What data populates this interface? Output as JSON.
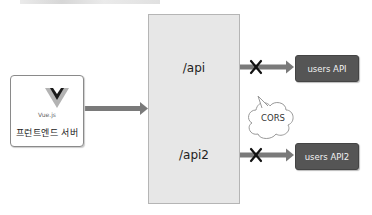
{
  "diagram": {
    "top_text_cropped": "",
    "frontend": {
      "logo_label": "Vue.js",
      "label": "프런트엔드 서버"
    },
    "proxy": {
      "routes": [
        {
          "path": "/api"
        },
        {
          "path": "/api2"
        }
      ]
    },
    "targets": [
      {
        "label": "users API",
        "blocked": true
      },
      {
        "label": "users API2",
        "blocked": true
      }
    ],
    "callout": {
      "label": "CORS"
    },
    "colors": {
      "proxy_fill": "#e7e7e7",
      "api_fill": "#555555",
      "arrow": "#7a7a7a",
      "block_mark": "#111111"
    }
  }
}
